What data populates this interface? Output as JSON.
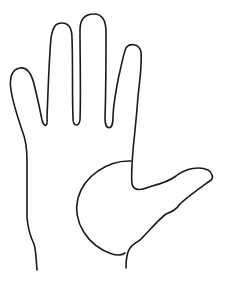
{
  "figure": {
    "description": "Line drawing of an open hand with five fingers; palm base drawn as a semicircle",
    "stroke_color": "#1a1a1a",
    "background_color": "#ffffff",
    "parts": [
      "pinky",
      "ring-finger",
      "middle-finger",
      "index-finger",
      "thumb",
      "palm-semicircle",
      "wrist"
    ]
  }
}
